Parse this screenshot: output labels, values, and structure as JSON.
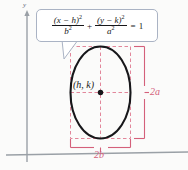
{
  "figure": {
    "axes": {
      "y_label": "y",
      "axis_color": "#9aa0a6"
    },
    "callout": {
      "equation_plain": "(x - h)^2 / b^2 + (y - k)^2 / a^2 = 1",
      "term1": {
        "numerator_base": "(x − h)",
        "numerator_exp": "2",
        "denominator_base": "b",
        "denominator_exp": "2"
      },
      "operator": "+",
      "term2": {
        "numerator_base": "(y − k)",
        "numerator_exp": "2",
        "denominator_base": "a",
        "denominator_exp": "2"
      },
      "equals": "=",
      "result": "1",
      "border_color": "#aab3c4",
      "background_color": "#ffffff"
    },
    "ellipse": {
      "center_label": "(h, k)",
      "stroke_color": "#17171a",
      "center_dot_color": "#17171a"
    },
    "dimensions": {
      "vertical_label": "2a",
      "horizontal_label": "2b",
      "guide_color": "#d4607a"
    }
  }
}
